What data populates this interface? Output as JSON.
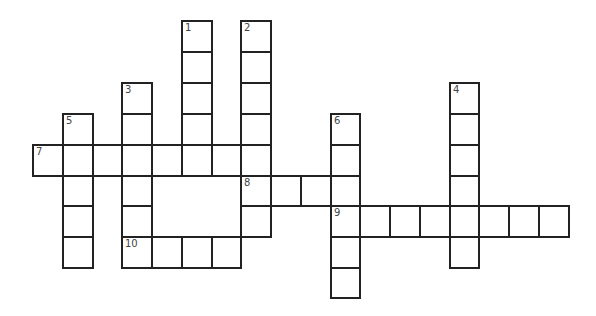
{
  "puzzle": {
    "type": "crossword",
    "grid_origin": {
      "x": 33,
      "y": 21
    },
    "cell_width": 29.75,
    "row_tops": [
      21,
      52,
      83,
      114,
      145,
      176,
      206,
      237,
      268,
      298
    ],
    "colors": {
      "border": "#222222",
      "number": "#444444",
      "background": "#ffffff"
    }
  },
  "entries": [
    {
      "number": "1",
      "direction": "down",
      "row": 0,
      "col": 5,
      "length": 5
    },
    {
      "number": "2",
      "direction": "down",
      "row": 0,
      "col": 7,
      "length": 7
    },
    {
      "number": "3",
      "direction": "down",
      "row": 2,
      "col": 3,
      "length": 6
    },
    {
      "number": "4",
      "direction": "down",
      "row": 2,
      "col": 14,
      "length": 6
    },
    {
      "number": "5",
      "direction": "down",
      "row": 3,
      "col": 1,
      "length": 5
    },
    {
      "number": "6",
      "direction": "down",
      "row": 3,
      "col": 10,
      "length": 6
    },
    {
      "number": "7",
      "direction": "across",
      "row": 4,
      "col": 0,
      "length": 8
    },
    {
      "number": "8",
      "direction": "across",
      "row": 5,
      "col": 7,
      "length": 4
    },
    {
      "number": "9",
      "direction": "across",
      "row": 6,
      "col": 10,
      "length": 8
    },
    {
      "number": "10",
      "direction": "across",
      "row": 7,
      "col": 3,
      "length": 4
    }
  ]
}
